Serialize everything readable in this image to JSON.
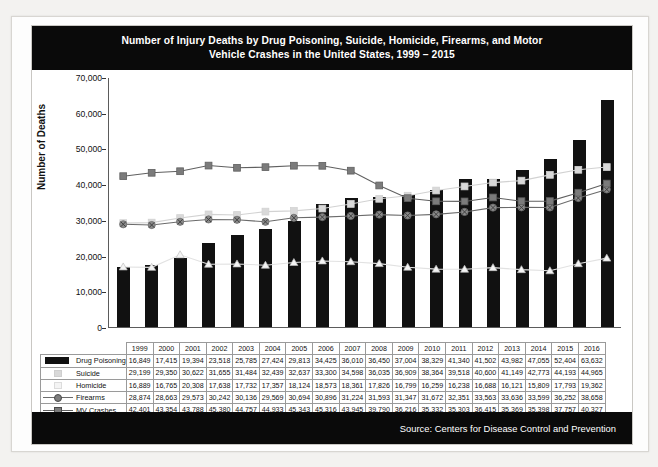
{
  "chart_data": {
    "type": "bar",
    "title": "Number of Injury Deaths by Drug Poisoning, Suicide, Homicide, Firearms, and Motor Vehicle Crashes in the United States, 1999 – 2015",
    "title_line1": "Number of Injury Deaths by Drug Poisoning, Suicide, Homicide, Firearms, and Motor",
    "title_line2": "Vehicle Crashes in the United States, 1999 – 2015",
    "xlabel": "",
    "ylabel": "Number of Deaths",
    "ylim": [
      0,
      70000
    ],
    "ytick_labels": [
      "70,000",
      "60,000",
      "50,000",
      "40,000",
      "30,000",
      "20,000",
      "10,000",
      "0"
    ],
    "ytick_values": [
      70000,
      60000,
      50000,
      40000,
      30000,
      20000,
      10000,
      0
    ],
    "grid": false,
    "legend_position": "table-left",
    "categories": [
      1999,
      2000,
      2001,
      2002,
      2003,
      2004,
      2005,
      2006,
      2007,
      2008,
      2009,
      2010,
      2011,
      2012,
      2013,
      2014,
      2015,
      2016
    ],
    "category_labels": [
      "1999",
      "2000",
      "2001",
      "2002",
      "2003",
      "2004",
      "2005",
      "2006",
      "2007",
      "2008",
      "2009",
      "2010",
      "2011",
      "2012",
      "2013",
      "2014",
      "2015",
      "2016"
    ],
    "series": [
      {
        "name": "Drug Poisoning",
        "render": "bar",
        "color": "#111111",
        "marker": "none",
        "values": [
          16849,
          17415,
          19394,
          23518,
          25785,
          27424,
          29813,
          34425,
          36010,
          36450,
          37004,
          38329,
          41340,
          41502,
          43982,
          47055,
          52404,
          63632
        ],
        "labels": [
          "16,849",
          "17,415",
          "19,394",
          "23,518",
          "25,785",
          "27,424",
          "29,813",
          "34,425",
          "36,010",
          "36,450",
          "37,004",
          "38,329",
          "41,340",
          "41,502",
          "43,982",
          "47,055",
          "52,404",
          "63,632"
        ]
      },
      {
        "name": "Suicide",
        "render": "line",
        "color": "#d2d2d2",
        "marker": "square",
        "marker_fill": "#d9d9d9",
        "values": [
          29199,
          29350,
          30622,
          31655,
          31484,
          32439,
          32637,
          33300,
          34598,
          36035,
          36909,
          38364,
          39518,
          40600,
          41149,
          42773,
          44193,
          44965
        ],
        "labels": [
          "29,199",
          "29,350",
          "30,622",
          "31,655",
          "31,484",
          "32,439",
          "32,637",
          "33,300",
          "34,598",
          "36,035",
          "36,909",
          "38,364",
          "39,518",
          "40,600",
          "41,149",
          "42,773",
          "44,193",
          "44,965"
        ]
      },
      {
        "name": "Homicide",
        "render": "line",
        "color": "#e2e2e2",
        "marker": "triangle",
        "marker_fill": "#f4f4f4",
        "values": [
          16889,
          16765,
          20308,
          17638,
          17732,
          17357,
          18124,
          18573,
          18361,
          17826,
          16799,
          16259,
          16238,
          16688,
          16121,
          15809,
          17793,
          19362
        ],
        "labels": [
          "16,889",
          "16,765",
          "20,308",
          "17,638",
          "17,732",
          "17,357",
          "18,124",
          "18,573",
          "18,361",
          "17,826",
          "16,799",
          "16,259",
          "16,238",
          "16,688",
          "16,121",
          "15,809",
          "17,793",
          "19,362"
        ]
      },
      {
        "name": "Firearms",
        "render": "line",
        "color": "#6b6b6b",
        "marker": "circle-x",
        "marker_fill": "#8a8a8a",
        "values": [
          28874,
          28663,
          29573,
          30242,
          30136,
          29569,
          30694,
          30896,
          31224,
          31593,
          31347,
          31672,
          32351,
          33563,
          33636,
          33599,
          36252,
          38658
        ],
        "labels": [
          "28,874",
          "28,663",
          "29,573",
          "30,242",
          "30,136",
          "29,569",
          "30,694",
          "30,896",
          "31,224",
          "31,593",
          "31,347",
          "31,672",
          "32,351",
          "33,563",
          "33,636",
          "33,599",
          "36,252",
          "38,658"
        ]
      },
      {
        "name": "MV Crashes",
        "render": "line",
        "color": "#606060",
        "marker": "square",
        "marker_fill": "#7b7b7b",
        "values": [
          42401,
          43354,
          43788,
          45380,
          44757,
          44933,
          45343,
          45316,
          43945,
          39790,
          36216,
          35332,
          35303,
          36415,
          35369,
          35398,
          37757,
          40327
        ],
        "labels": [
          "42,401",
          "43,354",
          "43,788",
          "45,380",
          "44,757",
          "44,933",
          "45,343",
          "45,316",
          "43,945",
          "39,790",
          "36,216",
          "35,332",
          "35,303",
          "36,415",
          "35,369",
          "35,398",
          "37,757",
          "40,327"
        ]
      }
    ]
  },
  "footer": {
    "source": "Source: Centers for Disease Control and Prevention"
  }
}
